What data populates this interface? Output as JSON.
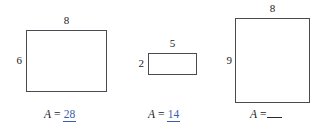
{
  "worksheet": {
    "figures": [
      {
        "id": "rectangle-1",
        "top_label": "8",
        "side_label": "6",
        "area_var": "A",
        "area_eq": "=",
        "area_value": "28",
        "answered": true
      },
      {
        "id": "rectangle-2",
        "top_label": "5",
        "side_label": "2",
        "area_var": "A",
        "area_eq": "=",
        "area_value": "14",
        "answered": true
      },
      {
        "id": "rectangle-3",
        "top_label": "8",
        "side_label": "9",
        "area_var": "A",
        "area_eq": "=",
        "area_value": "",
        "answered": false
      }
    ]
  },
  "colors": {
    "answer_blue": "#3a5fa8",
    "stroke": "#4a4a52",
    "text": "#1a1a1a",
    "background": "#ffffff"
  }
}
